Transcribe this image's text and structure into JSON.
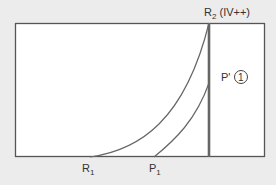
{
  "diagram": {
    "labels": {
      "r2": {
        "main": "R",
        "sub": "2",
        "suffix": " (IV++)"
      },
      "p_prime": {
        "main": "P'",
        "circle": "1"
      },
      "r1": {
        "main": "R",
        "sub": "1"
      },
      "p1": {
        "main": "P",
        "sub": "1"
      }
    },
    "colors": {
      "background": "#ececec",
      "panel": "#ffffff",
      "line": "#555555",
      "thick_line": "#666666",
      "curve": "#666666",
      "text": "#333333"
    }
  }
}
